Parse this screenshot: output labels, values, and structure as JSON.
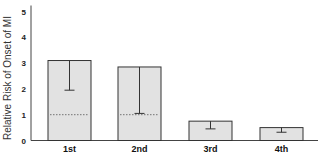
{
  "chart_data": {
    "type": "bar",
    "title": "",
    "xlabel": "",
    "ylabel": "Relative Risk of Onset of MI",
    "ylim": [
      0,
      5
    ],
    "yticks": [
      0,
      1,
      2,
      3,
      4,
      5
    ],
    "grid": false,
    "legend": null,
    "categories": [
      "1st",
      "2nd",
      "3rd",
      "4th"
    ],
    "values": [
      3.1,
      2.85,
      0.75,
      0.5
    ],
    "error_lower": [
      1.95,
      1.05,
      0.45,
      0.32
    ],
    "reference_line": 1.0,
    "bar_color": "#e2e2e2",
    "edge_color": "#333333"
  }
}
